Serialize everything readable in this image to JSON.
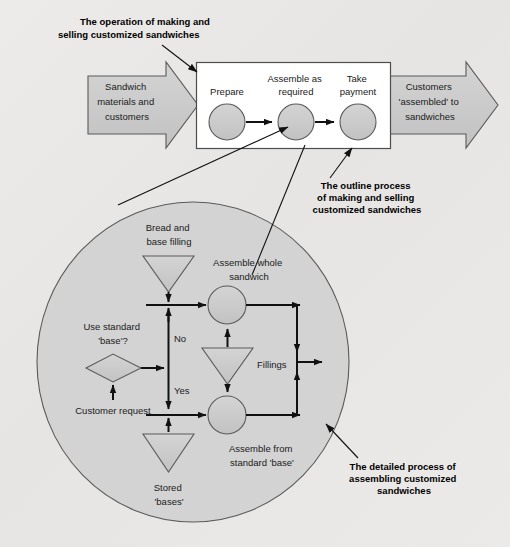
{
  "figure": {
    "background_color": "#e9e9e7",
    "shape_fill": "#c9c9c9",
    "shape_stroke": "#555555",
    "box_fill": "#ffffff",
    "ellipse_fill": "#d2d2d2"
  },
  "annotations": {
    "top_left": "The operation of making and\nselling customized sandwiches",
    "top_left_line1": "The operation of making and",
    "top_left_line2": "selling customized sandwiches",
    "outline_line1": "The outline process",
    "outline_line2": "of making and selling",
    "outline_line3": "customized sandwiches",
    "detail_line1": "The detailed process of",
    "detail_line2": "assembling customized",
    "detail_line3": "sandwiches"
  },
  "input_arrow": {
    "line1": "Sandwich",
    "line2": "materials and",
    "line3": "customers"
  },
  "output_arrow": {
    "line1": "Customers",
    "line2": "'assembled' to",
    "line3": "sandwiches"
  },
  "process_box": {
    "steps": [
      {
        "label_line1": "Prepare",
        "label_line2": ""
      },
      {
        "label_line1": "Assemble as",
        "label_line2": "required"
      },
      {
        "label_line1": "Take",
        "label_line2": "payment"
      }
    ]
  },
  "detail_process": {
    "bread_store_line1": "Bread and",
    "bread_store_line2": "base filling",
    "assemble_whole_line1": "Assemble whole",
    "assemble_whole_line2": "sandwich",
    "decision_line1": "Use standard",
    "decision_line2": "'base'?",
    "branch_no": "No",
    "branch_yes": "Yes",
    "fillings_label": "Fillings",
    "customer_request": "Customer request",
    "assemble_from_line1": "Assemble from",
    "assemble_from_line2": "standard 'base'",
    "stored_line1": "Stored",
    "stored_line2": "'bases'"
  }
}
